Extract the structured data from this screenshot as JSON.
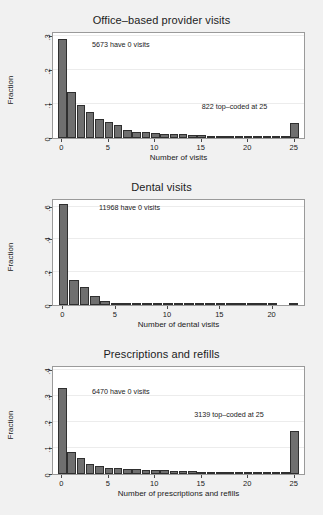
{
  "figure": {
    "background_color": "#f1f1f1",
    "plot_background_color": "#ffffff",
    "bar_fill_color": "#6f6f6f",
    "bar_outline_color": "#2f2f2f",
    "axis_color": "#4a4a4a"
  },
  "chart_data": [
    {
      "type": "bar",
      "title": "Office–based provider visits",
      "xlabel": "Number of visits",
      "ylabel": "Fraction",
      "xlim": [
        -1,
        26
      ],
      "ylim": [
        0,
        0.31
      ],
      "grid": true,
      "xticks": [
        0,
        5,
        10,
        15,
        20,
        25
      ],
      "xticklabels": [
        "0",
        "5",
        "10",
        "15",
        "20",
        "25"
      ],
      "yticks": [
        0,
        0.1,
        0.2,
        0.3
      ],
      "yticklabels": [
        "0",
        ".1",
        ".2",
        ".3"
      ],
      "categories": [
        0,
        1,
        2,
        3,
        4,
        5,
        6,
        7,
        8,
        9,
        10,
        11,
        12,
        13,
        14,
        15,
        16,
        17,
        18,
        19,
        20,
        21,
        22,
        23,
        24,
        25
      ],
      "values": [
        0.292,
        0.136,
        0.098,
        0.077,
        0.057,
        0.046,
        0.037,
        0.025,
        0.019,
        0.017,
        0.016,
        0.012,
        0.011,
        0.011,
        0.008,
        0.0075,
        0.005,
        0.0045,
        0.004,
        0.004,
        0.003,
        0.003,
        0.002,
        0.002,
        0.002,
        0.044
      ],
      "annotations": [
        {
          "text": "5673 have 0 visits",
          "x": 3.2,
          "y": 0.262
        },
        {
          "text": "822 top–coded at 25",
          "x": 15.0,
          "y": 0.079
        }
      ]
    },
    {
      "type": "bar",
      "title": "Dental visits",
      "xlabel": "Number of dental visits",
      "ylabel": "Fraction",
      "xlim": [
        -1,
        23
      ],
      "ylim": [
        0,
        0.64
      ],
      "grid": true,
      "xticks": [
        0,
        5,
        10,
        15,
        20
      ],
      "xticklabels": [
        "0",
        "5",
        "10",
        "15",
        "20"
      ],
      "yticks": [
        0,
        0.2,
        0.4,
        0.6
      ],
      "yticklabels": [
        "0",
        ".2",
        ".4",
        ".6"
      ],
      "categories": [
        0,
        1,
        2,
        3,
        4,
        5,
        6,
        7,
        8,
        9,
        10,
        11,
        12,
        13,
        14,
        15,
        16,
        17,
        18,
        19,
        20,
        22
      ],
      "values": [
        0.613,
        0.155,
        0.11,
        0.054,
        0.025,
        0.013,
        0.008,
        0.005,
        0.004,
        0.003,
        0.003,
        0.002,
        0.002,
        0.002,
        0.002,
        0.001,
        0.001,
        0.001,
        0.001,
        0.001,
        0.001,
        0.004
      ],
      "annotations": [
        {
          "text": "11968 have 0 visits",
          "x": 3.4,
          "y": 0.565
        }
      ]
    },
    {
      "type": "bar",
      "title": "Prescriptions and refills",
      "xlabel": "Number of prescriptions and refills",
      "ylabel": "Fraction",
      "xlim": [
        -1,
        26
      ],
      "ylim": [
        0,
        0.41
      ],
      "grid": true,
      "xticks": [
        0,
        5,
        10,
        15,
        20,
        25
      ],
      "xticklabels": [
        "0",
        "5",
        "10",
        "15",
        "20",
        "25"
      ],
      "yticks": [
        0,
        0.1,
        0.2,
        0.3,
        0.4
      ],
      "yticklabels": [
        "0",
        ".1",
        ".2",
        ".3",
        ".4"
      ],
      "categories": [
        0,
        1,
        2,
        3,
        4,
        5,
        6,
        7,
        8,
        9,
        10,
        11,
        12,
        13,
        14,
        15,
        16,
        17,
        18,
        19,
        20,
        21,
        22,
        23,
        24,
        25
      ],
      "values": [
        0.331,
        0.084,
        0.061,
        0.04,
        0.029,
        0.022,
        0.022,
        0.021,
        0.018,
        0.015,
        0.014,
        0.014,
        0.013,
        0.013,
        0.01,
        0.009,
        0.009,
        0.006,
        0.005,
        0.004,
        0.004,
        0.003,
        0.003,
        0.003,
        0.003,
        0.165
      ],
      "annotations": [
        {
          "text": "6470 have 0 visits",
          "x": 3.2,
          "y": 0.3
        },
        {
          "text": "3139 top–coded at 25",
          "x": 14.2,
          "y": 0.21
        }
      ]
    }
  ]
}
